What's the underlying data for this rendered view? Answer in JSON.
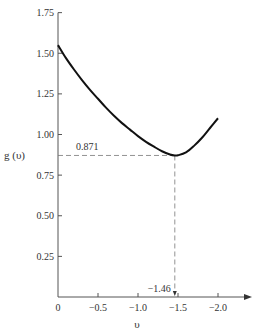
{
  "chart_data": {
    "type": "line",
    "title": "",
    "xlabel": "υ",
    "ylabel": "g (υ)",
    "xlim": [
      0,
      -2.3
    ],
    "ylim": [
      0,
      1.75
    ],
    "xticks": [
      0,
      -0.5,
      -1.0,
      -1.5,
      -2.0
    ],
    "xtick_labels": [
      "0",
      "−0.5",
      "−1.0",
      "−1.5",
      "−2.0"
    ],
    "yticks": [
      0.25,
      0.5,
      0.75,
      1.0,
      1.25,
      1.5,
      1.75
    ],
    "ytick_labels": [
      "0.25",
      "0.50",
      "0.75",
      "1.00",
      "1.25",
      "1.50",
      "1.75"
    ],
    "grid": false,
    "legend": "none",
    "series": [
      {
        "name": "g(υ)",
        "x": [
          0,
          -0.1,
          -0.2,
          -0.3,
          -0.4,
          -0.5,
          -0.6,
          -0.7,
          -0.8,
          -0.9,
          -1.0,
          -1.1,
          -1.2,
          -1.3,
          -1.4,
          -1.46,
          -1.5,
          -1.6,
          -1.7,
          -1.8,
          -1.9,
          -2.0
        ],
        "y": [
          1.55,
          1.47,
          1.4,
          1.335,
          1.275,
          1.22,
          1.165,
          1.115,
          1.07,
          1.03,
          0.99,
          0.955,
          0.925,
          0.897,
          0.877,
          0.871,
          0.872,
          0.89,
          0.93,
          0.98,
          1.04,
          1.1
        ]
      }
    ],
    "annotations": [
      {
        "text": "0.871",
        "kind": "y-reference",
        "value": 0.871
      },
      {
        "text": "−1.46",
        "kind": "x-reference",
        "value": -1.46
      }
    ]
  }
}
